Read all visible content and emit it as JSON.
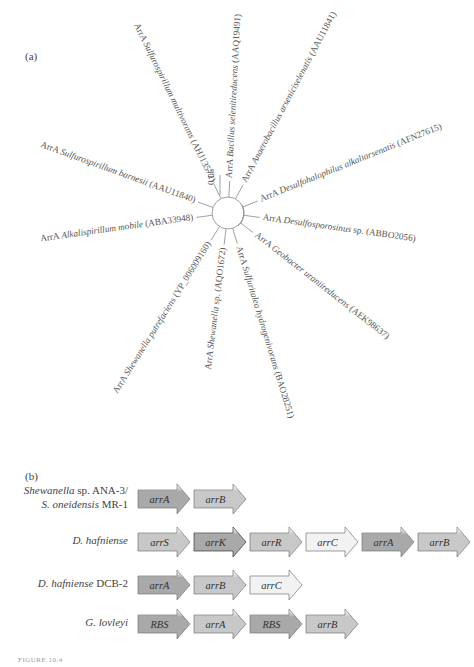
{
  "panel_a": {
    "label": "(a)",
    "scale_bar": "0.05",
    "leaves": [
      {
        "prefix": "ArrA ",
        "species": "Bacillus selenitireducens",
        "accession": " (AAQ19491)",
        "angle": -87
      },
      {
        "prefix": "ArrA ",
        "species": "Anaerobacillus arseniciselenatis",
        "accession": " (AAU11841)",
        "angle": -62
      },
      {
        "prefix": "ArrA ",
        "species": "Desulfohalophilus alkaliarsenatis",
        "accession": " (AFN27615)",
        "angle": -22
      },
      {
        "prefix": "ArrA ",
        "species": "Desulfosporosinus",
        "suffix": " sp.",
        "accession": " (ABBO2056)",
        "angle": 8
      },
      {
        "prefix": "ArrA ",
        "species": "Geobacter uraniireducens",
        "accession": " (AEK98637)",
        "angle": 38
      },
      {
        "prefix": "ArrA ",
        "species": "Sulfuritalea hydrogenivorans",
        "accession": " (BAO28251)",
        "angle": 73
      },
      {
        "prefix": "ArrA ",
        "species": "Shewanella",
        "suffix": " sp.",
        "accession": " (AQO1672)",
        "angle": 97
      },
      {
        "prefix": "ArrA ",
        "species": "Shewanella putrefaciens",
        "accession": " (YP_006009160)",
        "angle": 122
      },
      {
        "prefix": "ArrA ",
        "species": "Alkalispirillum mobile",
        "accession": " (ABA33948)",
        "angle": 172
      },
      {
        "prefix": "ArrA ",
        "species": "Sulfurospirillum barnesii",
        "accession": " (AAU11840)",
        "angle": 200
      },
      {
        "prefix": "ArrA ",
        "species": "Sulfurospirillum multivorans",
        "accession": " (AHJ13572)",
        "angle": 244
      }
    ]
  },
  "panel_b": {
    "label": "(b)",
    "colors": {
      "dark": "#a9a9a9",
      "mid": "#c8c8c8",
      "light": "#f2f2f2",
      "outline": "#777777"
    },
    "rows": [
      {
        "organism_lines": [
          {
            "italic": "Shewanella",
            "normal": " sp. ANA-3/"
          },
          {
            "italic": "S. oneidensis",
            "normal": " MR-1"
          }
        ],
        "genes": [
          {
            "name": "arrA",
            "shade": "dark"
          },
          {
            "name": "arrB",
            "shade": "mid"
          }
        ]
      },
      {
        "organism_lines": [
          {
            "italic": "D. hafniense",
            "normal": ""
          }
        ],
        "genes": [
          {
            "name": "arrS",
            "shade": "mid"
          },
          {
            "name": "arrK",
            "shade": "dark"
          },
          {
            "name": "arrR",
            "shade": "mid"
          },
          {
            "name": "arrC",
            "shade": "light"
          },
          {
            "name": "arrA",
            "shade": "dark"
          },
          {
            "name": "arrB",
            "shade": "mid"
          }
        ]
      },
      {
        "organism_lines": [
          {
            "italic": "D. hafniense",
            "normal": " DCB-2"
          }
        ],
        "genes": [
          {
            "name": "arrA",
            "shade": "dark"
          },
          {
            "name": "arrB",
            "shade": "mid"
          },
          {
            "name": "arrC",
            "shade": "light"
          }
        ]
      },
      {
        "organism_lines": [
          {
            "italic": "G. lovleyi",
            "normal": ""
          }
        ],
        "genes": [
          {
            "name": "RBS",
            "shade": "dark"
          },
          {
            "name": "arrA",
            "shade": "mid"
          },
          {
            "name": "RBS",
            "shade": "dark"
          },
          {
            "name": "arrB",
            "shade": "mid"
          }
        ]
      }
    ]
  },
  "caption": "FIGURE 10.4"
}
